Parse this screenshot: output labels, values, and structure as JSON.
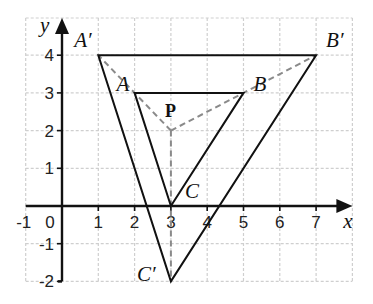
{
  "diagram": {
    "type": "coordinate-plane-enlargement",
    "axes": {
      "x_label": "x",
      "y_label": "y",
      "x_ticks": [
        "-1",
        "0",
        "1",
        "2",
        "3",
        "4",
        "5",
        "6",
        "7"
      ],
      "y_ticks": [
        "4",
        "3",
        "2",
        "1",
        "-1",
        "-2"
      ],
      "x_range": [
        -1,
        8
      ],
      "y_range": [
        -2,
        4.5
      ],
      "grid": true
    },
    "points": {
      "A": {
        "label": "A",
        "x": 2,
        "y": 3
      },
      "B": {
        "label": "B",
        "x": 5,
        "y": 3
      },
      "C": {
        "label": "C",
        "x": 3,
        "y": 0
      },
      "A_prime": {
        "label": "A′",
        "x": 1,
        "y": 4
      },
      "B_prime": {
        "label": "B′",
        "x": 7,
        "y": 4
      },
      "C_prime": {
        "label": "C′",
        "x": 3,
        "y": -2
      },
      "P": {
        "label": "P",
        "x": 3,
        "y": 2
      }
    },
    "triangles": [
      {
        "name": "ABC",
        "vertices": [
          "A",
          "B",
          "C"
        ]
      },
      {
        "name": "A'B'C'",
        "vertices": [
          "A_prime",
          "B_prime",
          "C_prime"
        ]
      }
    ],
    "center_rays": [
      "P-A_prime",
      "P-B_prime",
      "P-C_prime"
    ],
    "colors": {
      "lines": "#111111",
      "dashed_rays": "#8a8a8a",
      "grid": "#cfcfcf"
    }
  }
}
